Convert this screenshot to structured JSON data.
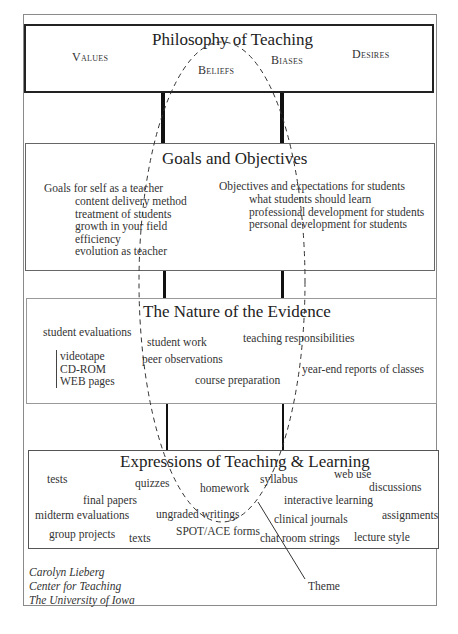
{
  "philosophy": {
    "title": "Philosophy of Teaching",
    "items": [
      "Values",
      "Beliefs",
      "Biases",
      "Desires"
    ]
  },
  "goals": {
    "title": "Goals and Objectives",
    "self": {
      "heading": "Goals for self as a teacher",
      "items": [
        "content delivery method",
        "treatment of students",
        "growth in your field",
        "efficiency",
        "evolution as teacher"
      ]
    },
    "students": {
      "heading": "Objectives and expectations for students",
      "items": [
        "what students should learn",
        "professional development for students",
        "personal development for students"
      ]
    }
  },
  "evidence": {
    "title": "The Nature of the Evidence",
    "items": {
      "student_evaluations": "student evaluations",
      "student_work": "student work",
      "teaching_responsibilities": "teaching responsibilities",
      "peer_observations": "peer observations",
      "year_end_reports": "year-end reports of classes",
      "course_preparation": "course preparation"
    },
    "media": [
      "videotape",
      "CD-ROM",
      "WEB pages"
    ]
  },
  "expressions": {
    "title": "Expressions of Teaching & Learning",
    "items": {
      "tests": "tests",
      "quizzes": "quizzes",
      "homework": "homework",
      "syllabus": "syllabus",
      "web_use": "web use",
      "discussions": "discussions",
      "final_papers": "final papers",
      "interactive_learning": "interactive learning",
      "midterm_evaluations": "midterm evaluations",
      "ungraded_writings": "ungraded writings",
      "clinical_journals": "clinical journals",
      "assignments": "assignments",
      "group_projects": "group projects",
      "texts": "texts",
      "spot_ace_forms": "SPOT/ACE forms",
      "chat_room_strings": "chat room strings",
      "lecture_style": "lecture style"
    }
  },
  "credit": [
    "Carolyn Lieberg",
    "Center for Teaching",
    "The University of Iowa"
  ],
  "theme_label": "Theme",
  "colors": {
    "line": "#222222",
    "border": "#8a8a8a",
    "text": "#333333"
  }
}
